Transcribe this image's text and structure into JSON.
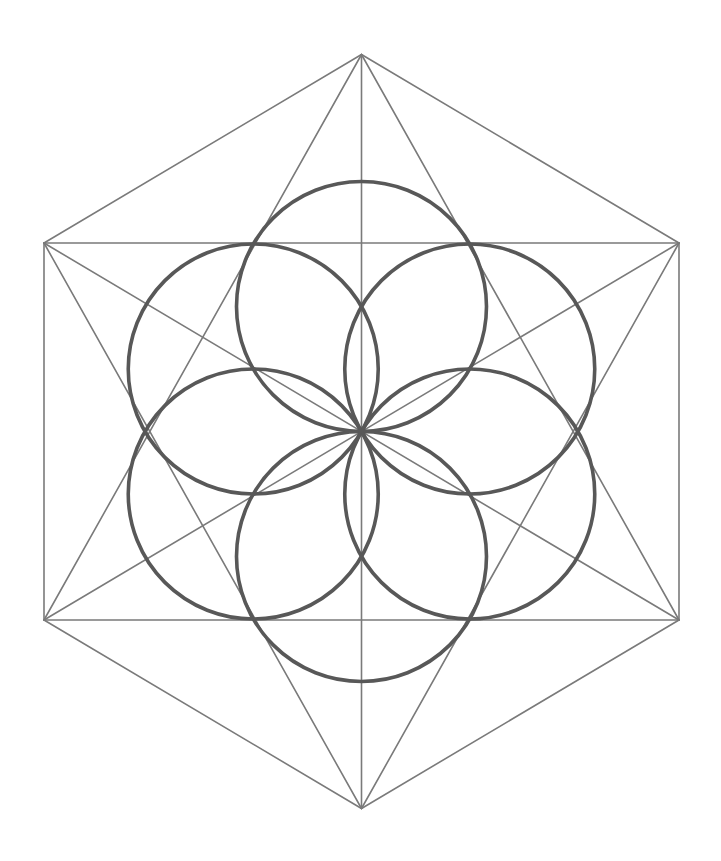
{
  "diagram": {
    "title": "",
    "colors": {
      "background": "#ffffff",
      "lines": "#7a7a7a",
      "circles": "#585858"
    },
    "hexagon_vertices": [
      "top",
      "top-right",
      "bottom-right",
      "bottom",
      "bottom-left",
      "top-left"
    ],
    "line_segments": [
      {
        "name": "hexagon-edge-top-right",
        "from": "top",
        "to": "top-right"
      },
      {
        "name": "hexagon-edge-right",
        "from": "top-right",
        "to": "bottom-right"
      },
      {
        "name": "hexagon-edge-bottom-right",
        "from": "bottom-right",
        "to": "bottom"
      },
      {
        "name": "hexagon-edge-bottom-left",
        "from": "bottom",
        "to": "bottom-left"
      },
      {
        "name": "hexagon-edge-left",
        "from": "bottom-left",
        "to": "top-left"
      },
      {
        "name": "hexagon-edge-top-left",
        "from": "top-left",
        "to": "top"
      },
      {
        "name": "star-up-left",
        "from": "top",
        "to": "bottom-left"
      },
      {
        "name": "star-up-right",
        "from": "top",
        "to": "bottom-right"
      },
      {
        "name": "star-bottom-left",
        "from": "bottom",
        "to": "top-left"
      },
      {
        "name": "star-bottom-right",
        "from": "bottom",
        "to": "top-right"
      },
      {
        "name": "chord-top",
        "from": "top-left",
        "to": "top-right"
      },
      {
        "name": "chord-bottom",
        "from": "bottom-left",
        "to": "bottom-right"
      },
      {
        "name": "diagonal-vertical",
        "from": "top",
        "to": "bottom"
      },
      {
        "name": "diagonal-tl-br",
        "from": "top-left",
        "to": "bottom-right"
      },
      {
        "name": "diagonal-tr-bl",
        "from": "top-right",
        "to": "bottom-left"
      }
    ],
    "circles": [
      {
        "name": "circle-top",
        "angle_deg": 90
      },
      {
        "name": "circle-upper-right",
        "angle_deg": 30
      },
      {
        "name": "circle-lower-right",
        "angle_deg": -30
      },
      {
        "name": "circle-bottom",
        "angle_deg": -90
      },
      {
        "name": "circle-lower-left",
        "angle_deg": -150
      },
      {
        "name": "circle-upper-left",
        "angle_deg": 150
      }
    ]
  }
}
